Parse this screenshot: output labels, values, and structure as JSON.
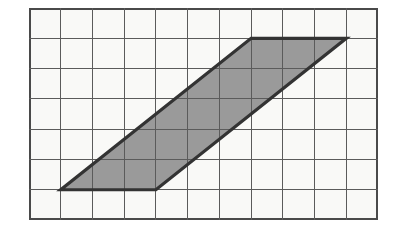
{
  "figure": {
    "kind": "grid-parallelogram-diagram",
    "colors": {
      "page_background": "#ffffff",
      "grid_background": "#f9f9f7",
      "grid_line": "#5b5b5b",
      "grid_border": "#4a4a4a",
      "shape_fill": "#9a9a9a",
      "shape_outline": "#333333"
    },
    "grid": {
      "columns": 11,
      "rows": 7,
      "cell_width": 31.73,
      "cell_height": 30.29,
      "origin_x": 29,
      "origin_y": 8,
      "width": 349,
      "height": 212,
      "show_lines": true,
      "show_border": true
    },
    "shape": {
      "type": "parallelogram",
      "vertices_grid": [
        {
          "col": 1,
          "row": 6
        },
        {
          "col": 4,
          "row": 6
        },
        {
          "col": 10,
          "row": 1
        },
        {
          "col": 7,
          "row": 1
        }
      ],
      "base_cells": 3,
      "height_cells": 5,
      "slant_offset_cells": 6,
      "area_cells": 15,
      "outline_width": 3.2
    }
  }
}
